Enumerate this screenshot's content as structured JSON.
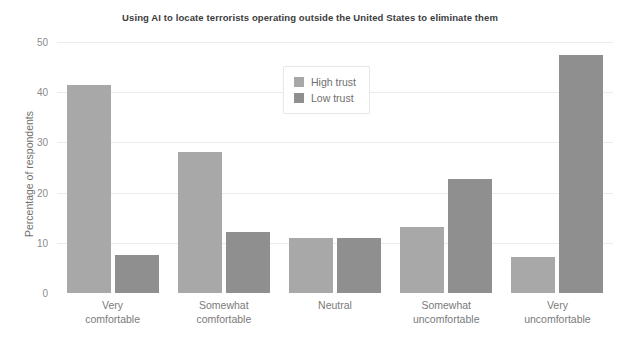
{
  "chart_data": {
    "type": "bar",
    "title": "Using AI to locate terrorists operating outside the United States to eliminate them",
    "xlabel": "",
    "ylabel": "Percentage of respondents",
    "ylim": [
      0,
      50
    ],
    "yticks": [
      0,
      10,
      20,
      30,
      40,
      50
    ],
    "ytick_labels": [
      "0",
      "10",
      "20",
      "30",
      "40",
      "50"
    ],
    "grid": true,
    "legend_position": "upper center",
    "categories": [
      "Very comfortable",
      "Somewhat comfortable",
      "Neutral",
      "Somewhat uncomfortable",
      "Very uncomfortable"
    ],
    "category_lines": [
      [
        "Very",
        "comfortable"
      ],
      [
        "Somewhat",
        "comfortable"
      ],
      [
        "Neutral",
        ""
      ],
      [
        "Somewhat",
        "uncomfortable"
      ],
      [
        "Very",
        "uncomfortable"
      ]
    ],
    "series": [
      {
        "name": "High trust",
        "color": "#a8a8a8",
        "values": [
          41.5,
          28.0,
          11.0,
          13.2,
          7.2
        ]
      },
      {
        "name": "Low trust",
        "color": "#8f8f8f",
        "values": [
          7.5,
          12.2,
          11.0,
          22.7,
          47.5
        ]
      }
    ]
  },
  "colors": {
    "background": "#ffffff",
    "gridline": "#eceaea",
    "title_text": "#3d3d3d",
    "axis_text": "#7a7a7a",
    "tick_text": "#8c8c8c",
    "series_high": "#a8a8a8",
    "series_low": "#8f8f8f"
  }
}
